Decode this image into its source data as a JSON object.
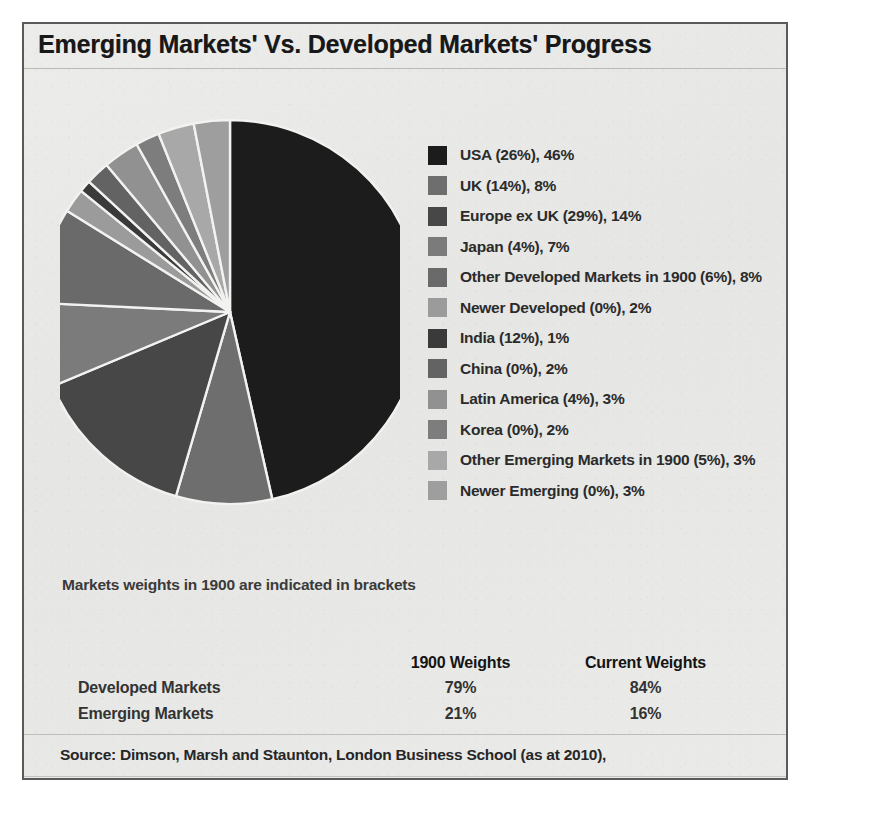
{
  "header": {
    "title": "Emerging Markets' Vs. Developed Markets' Progress"
  },
  "note": {
    "brackets": "Markets weights in 1900 are indicated in brackets"
  },
  "source": {
    "text": "Source: Dimson, Marsh and Staunton, London Business School (as at 2010),"
  },
  "table": {
    "columns": [
      "",
      "1900 Weights",
      "Current Weights"
    ],
    "rows": [
      {
        "label": "Developed Markets",
        "weight_1900": "79%",
        "weight_current": "84%"
      },
      {
        "label": "Emerging Markets",
        "weight_1900": "21%",
        "weight_current": "16%"
      }
    ]
  },
  "legend": {
    "items": [
      {
        "label": "USA (26%), 46%",
        "color": "#1c1c1c"
      },
      {
        "label": "UK (14%), 8%",
        "color": "#6e6e6e"
      },
      {
        "label": "Europe ex UK (29%), 14%",
        "color": "#474747"
      },
      {
        "label": "Japan (4%), 7%",
        "color": "#7b7b7b"
      },
      {
        "label": "Other Developed Markets in 1900 (6%), 8%",
        "color": "#6a6a6a"
      },
      {
        "label": "Newer Developed (0%), 2%",
        "color": "#9b9b9b"
      },
      {
        "label": "India (12%), 1%",
        "color": "#3a3a3a"
      },
      {
        "label": "China (0%), 2%",
        "color": "#636363"
      },
      {
        "label": "Latin America (4%), 3%",
        "color": "#919191"
      },
      {
        "label": "Korea (0%), 2%",
        "color": "#7d7d7d"
      },
      {
        "label": "Other Emerging Markets in 1900 (5%), 3%",
        "color": "#a8a8a8"
      },
      {
        "label": "Newer Emerging (0%), 3%",
        "color": "#9e9e9e"
      }
    ]
  },
  "chart_data": {
    "type": "pie",
    "title": "Emerging Markets' Vs. Developed Markets' Progress",
    "subtitle": "Markets weights in 1900 are indicated in brackets",
    "value_unit": "percent of world market capitalisation (current)",
    "start_angle_deg": 0,
    "direction": "clockwise",
    "legend_position": "right",
    "grid": false,
    "labels": [
      "USA",
      "UK",
      "Europe ex UK",
      "Japan",
      "Other Developed Markets in 1900",
      "Newer Developed",
      "India",
      "China",
      "Latin America",
      "Korea",
      "Other Emerging Markets in 1900",
      "Newer Emerging"
    ],
    "values": [
      46,
      8,
      14,
      7,
      8,
      2,
      1,
      2,
      3,
      2,
      3,
      3
    ],
    "weights_1900": [
      26,
      14,
      29,
      4,
      6,
      0,
      12,
      0,
      4,
      0,
      5,
      0
    ],
    "colors": [
      "#1c1c1c",
      "#6e6e6e",
      "#474747",
      "#7b7b7b",
      "#6a6a6a",
      "#9b9b9b",
      "#3a3a3a",
      "#636363",
      "#919191",
      "#7d7d7d",
      "#a8a8a8",
      "#9e9e9e"
    ],
    "slice_separator_color": "#f2f2f0",
    "summary": {
      "categories": [
        "Developed Markets",
        "Emerging Markets"
      ],
      "series": [
        {
          "name": "1900 Weights",
          "values": [
            79,
            21
          ]
        },
        {
          "name": "Current Weights",
          "values": [
            84,
            16
          ]
        }
      ]
    }
  }
}
